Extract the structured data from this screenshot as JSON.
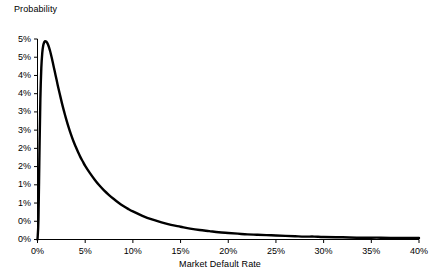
{
  "chart_data": {
    "type": "line",
    "title": "",
    "xlabel": "Market Default Rate",
    "ylabel": "Probability",
    "xlim": [
      0,
      40
    ],
    "ylim": [
      0,
      5.5
    ],
    "grid": false,
    "legend": null,
    "x_unit": "percent",
    "y_unit": "percent",
    "x_tick_labels": [
      "0%",
      "5%",
      "10%",
      "15%",
      "20%",
      "25%",
      "30%",
      "35%",
      "40%"
    ],
    "x_tick_values": [
      0,
      5,
      10,
      15,
      20,
      25,
      30,
      35,
      40
    ],
    "y_tick_labels": [
      "5%",
      "5%",
      "4%",
      "4%",
      "3%",
      "3%",
      "2%",
      "2%",
      "1%",
      "1%",
      "0%"
    ],
    "y_tick_values": [
      5.5,
      5.0,
      4.5,
      4.0,
      3.5,
      3.0,
      2.5,
      2.0,
      1.5,
      1.0,
      0.5
    ],
    "y_axis_baseline_label": "0%",
    "y_axis_baseline_value": 0.0,
    "series": [
      {
        "name": "Probability density of market default rate",
        "color": "#000000",
        "line_width": 2.4,
        "x": [
          0.0,
          0.1,
          0.2,
          0.3,
          0.4,
          0.5,
          0.6,
          0.7,
          0.8,
          0.9,
          1.0,
          1.1,
          1.2,
          1.3,
          1.4,
          1.5,
          1.6,
          1.7,
          1.8,
          1.9,
          2.0,
          2.2,
          2.4,
          2.6,
          2.8,
          3.0,
          3.25,
          3.5,
          3.75,
          4.0,
          4.25,
          4.5,
          4.75,
          5.0,
          5.5,
          6.0,
          6.5,
          7.0,
          7.5,
          8.0,
          8.5,
          9.0,
          9.5,
          10.0,
          11.0,
          12.0,
          13.0,
          14.0,
          15.0,
          16.0,
          17.0,
          18.0,
          19.0,
          20.0,
          21.0,
          22.0,
          23.0,
          24.0,
          25.0,
          26.0,
          27.0,
          28.0,
          29.0,
          30.0,
          32.0,
          34.0,
          36.0,
          38.0,
          40.0
        ],
        "y": [
          0.0,
          0.55,
          2.3,
          3.85,
          4.7,
          5.12,
          5.32,
          5.41,
          5.44,
          5.43,
          5.4,
          5.35,
          5.28,
          5.19,
          5.09,
          4.98,
          4.86,
          4.74,
          4.62,
          4.5,
          4.38,
          4.14,
          3.92,
          3.7,
          3.5,
          3.31,
          3.09,
          2.89,
          2.71,
          2.55,
          2.4,
          2.26,
          2.14,
          2.02,
          1.82,
          1.64,
          1.48,
          1.34,
          1.22,
          1.11,
          1.01,
          0.92,
          0.84,
          0.77,
          0.65,
          0.55,
          0.47,
          0.4,
          0.35,
          0.3,
          0.26,
          0.23,
          0.2,
          0.18,
          0.16,
          0.14,
          0.13,
          0.12,
          0.11,
          0.1,
          0.09,
          0.08,
          0.08,
          0.07,
          0.06,
          0.05,
          0.05,
          0.04,
          0.04
        ]
      }
    ],
    "annotations": [],
    "peak": {
      "x": 0.8,
      "y": 5.44
    }
  },
  "axes": {
    "y_title": "Probability",
    "x_title": "Market Default Rate"
  },
  "style": {
    "background": "#ffffff",
    "axis_color": "#000000",
    "line_color": "#000000",
    "text_color": "#000000"
  }
}
